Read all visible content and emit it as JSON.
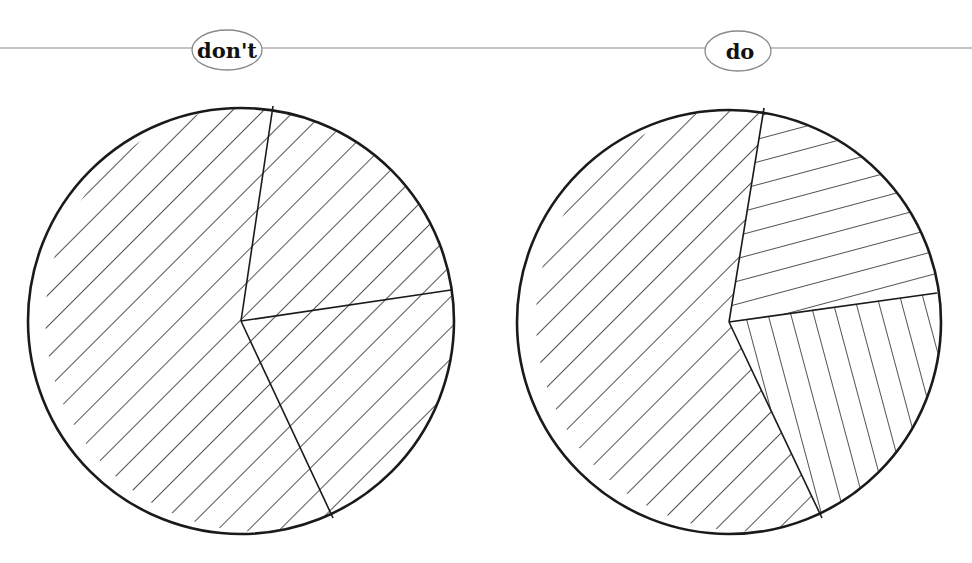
{
  "colors": {
    "background": "#ffffff",
    "stroke": "#1a1a1a",
    "rule": "#8a8a8a"
  },
  "header_rule": {
    "y": 48
  },
  "panels": [
    {
      "id": "dont",
      "label": "don't",
      "label_badge": {
        "cx": 227,
        "cy": 50,
        "rx": 35,
        "ry": 20
      },
      "pie": {
        "cx": 241,
        "cy": 321,
        "r": 213,
        "slices": [
          {
            "name": "large-slice",
            "hatch": "diagonal-down",
            "from": [
              273,
              106
            ],
            "to": [
              333,
              518
            ]
          },
          {
            "name": "top-right-slice",
            "hatch": "diagonal-down",
            "from": [
              451,
              290
            ],
            "to": [
              273,
              106
            ]
          },
          {
            "name": "bottom-right-slice",
            "hatch": "diagonal-down",
            "from": [
              333,
              518
            ],
            "to": [
              451,
              290
            ]
          }
        ]
      },
      "note": "All slices share the same hatch pattern"
    },
    {
      "id": "do",
      "label": "do",
      "label_badge": {
        "cx": 738,
        "cy": 51,
        "rx": 33,
        "ry": 20
      },
      "pie": {
        "cx": 729,
        "cy": 322,
        "r": 212,
        "slices": [
          {
            "name": "large-slice",
            "hatch": "diagonal-down",
            "from": [
              764,
              108
            ],
            "to": [
              822,
              518
            ]
          },
          {
            "name": "top-right-slice",
            "hatch": "near-horizontal",
            "from": [
              937,
              293
            ],
            "to": [
              764,
              108
            ]
          },
          {
            "name": "bottom-right-slice",
            "hatch": "near-vertical",
            "from": [
              822,
              518
            ],
            "to": [
              937,
              293
            ]
          }
        ]
      },
      "note": "Each slice uses a distinct hatch pattern"
    }
  ]
}
